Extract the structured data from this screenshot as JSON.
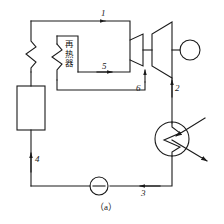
{
  "figure": {
    "caption": "（a）",
    "type": "reheat-rankine-cycle-schematic",
    "line_color": "#1a1a1a"
  },
  "components": {
    "boiler": {
      "name": "boiler",
      "label": ""
    },
    "superheater": {
      "name": "superheater-coil",
      "label": ""
    },
    "reheater": {
      "name": "reheater",
      "label": "再热器"
    },
    "hp_turbine": {
      "name": "high-pressure-turbine",
      "label": ""
    },
    "lp_turbine": {
      "name": "low-pressure-turbine",
      "label": ""
    },
    "generator": {
      "name": "generator",
      "label": ""
    },
    "condenser": {
      "name": "condenser",
      "label": ""
    },
    "pump": {
      "name": "feed-pump",
      "label": ""
    }
  },
  "state_points": [
    {
      "id": "p1",
      "label": "1"
    },
    {
      "id": "p5",
      "label": "5"
    },
    {
      "id": "p6",
      "label": "6"
    },
    {
      "id": "p2",
      "label": "2"
    },
    {
      "id": "p3",
      "label": "3"
    },
    {
      "id": "p4",
      "label": "4"
    }
  ]
}
